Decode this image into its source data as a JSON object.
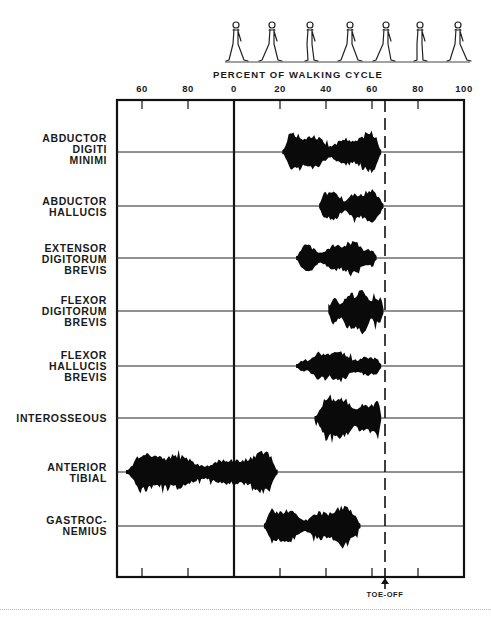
{
  "figure": {
    "axis_title": "PERCENT OF WALKING CYCLE",
    "tick_labels": [
      {
        "label": "60",
        "x": 142
      },
      {
        "label": "80",
        "x": 188
      },
      {
        "label": "0",
        "x": 234
      },
      {
        "label": "20",
        "x": 280
      },
      {
        "label": "40",
        "x": 326
      },
      {
        "label": "60",
        "x": 372
      },
      {
        "label": "80",
        "x": 418
      },
      {
        "label": "100",
        "x": 464
      }
    ],
    "toe_off_label": "TOE-OFF",
    "muscles": [
      {
        "label": "ABDUCTOR\nDIGITI\nMINIMI",
        "top": 133
      },
      {
        "label": "ABDUCTOR\nHALLUCIS",
        "top": 196
      },
      {
        "label": "EXTENSOR\nDIGITORUM\nBREVIS",
        "top": 243
      },
      {
        "label": "FLEXOR\nDIGITORUM\nBREVIS",
        "top": 295
      },
      {
        "label": "FLEXOR\nHALLUCIS\nBREVIS",
        "top": 350
      },
      {
        "label": "INTEROSSEOUS",
        "top": 413
      },
      {
        "label": "ANTERIOR\nTIBIAL",
        "top": 462
      },
      {
        "label": "GASTROC-\nNEMIUS",
        "top": 515
      }
    ]
  },
  "chart_data": {
    "type": "bar",
    "subtype": "EMG activity timeline (horizontal range bars)",
    "title": "",
    "xlabel": "PERCENT OF WALKING CYCLE",
    "ylabel": "",
    "x_tick_labels": [
      "60",
      "80",
      "0",
      "20",
      "40",
      "60",
      "80",
      "100"
    ],
    "xlim_note": "axis begins at ~49% of the previous cycle, wraps to 0 at heel strike, runs to 100",
    "annotations": [
      {
        "label": "TOE-OFF",
        "x_percent": 65,
        "style": "dashed vertical line with arrow"
      }
    ],
    "gait_figures": 7,
    "grid": false,
    "categories": [
      "ABDUCTOR DIGITI MINIMI",
      "ABDUCTOR HALLUCIS",
      "EXTENSOR DIGITORUM BREVIS",
      "FLEXOR DIGITORUM BREVIS",
      "FLEXOR HALLUCIS BREVIS",
      "INTEROSSEOUS",
      "ANTERIOR TIBIAL",
      "GASTROCNEMIUS"
    ],
    "series": [
      {
        "name": "ABDUCTOR DIGITI MINIMI",
        "start": 21,
        "end": 64,
        "baseline_y": 152,
        "amp": 17
      },
      {
        "name": "ABDUCTOR HALLUCIS",
        "start": 37,
        "end": 65,
        "baseline_y": 206,
        "amp": 15
      },
      {
        "name": "EXTENSOR DIGITORUM BREVIS",
        "start": 27,
        "end": 62,
        "baseline_y": 258,
        "amp": 15
      },
      {
        "name": "FLEXOR DIGITORUM BREVIS",
        "start": 41,
        "end": 65,
        "baseline_y": 311,
        "amp": 20
      },
      {
        "name": "FLEXOR HALLUCIS BREVIS",
        "start": 27,
        "end": 64,
        "baseline_y": 366,
        "amp": 14
      },
      {
        "name": "INTEROSSEOUS",
        "start": 35,
        "end": 64,
        "baseline_y": 418,
        "amp": 20
      },
      {
        "name": "ANTERIOR TIBIAL",
        "start": -47,
        "end": 19,
        "baseline_y": 472,
        "amp": 17,
        "note": "begins ~53% of prior cycle, continues through heel strike to ~19%"
      },
      {
        "name": "GASTROCNEMIUS",
        "start": 13,
        "end": 55,
        "baseline_y": 526,
        "amp": 17
      }
    ]
  }
}
